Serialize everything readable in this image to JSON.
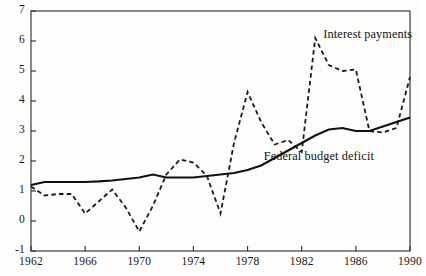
{
  "chart_data": {
    "type": "line",
    "title": "",
    "xlabel": "",
    "ylabel": "",
    "xlim": [
      1962,
      1990
    ],
    "ylim": [
      -1,
      7
    ],
    "grid": false,
    "legend_position": "inline-annotations",
    "yticks": [
      "7",
      "6",
      "5",
      "4",
      "3",
      "2",
      "1",
      "0",
      "-1"
    ],
    "ytick_values": [
      7,
      6,
      5,
      4,
      3,
      2,
      1,
      0,
      -1
    ],
    "xticks": [
      "1962",
      "1966",
      "1970",
      "1974",
      "1978",
      "1982",
      "1986",
      "1990"
    ],
    "xtick_values": [
      1962,
      1966,
      1970,
      1974,
      1978,
      1982,
      1986,
      1990
    ],
    "x": [
      1962,
      1963,
      1964,
      1965,
      1966,
      1967,
      1968,
      1969,
      1970,
      1971,
      1972,
      1973,
      1974,
      1975,
      1976,
      1977,
      1978,
      1979,
      1980,
      1981,
      1982,
      1983,
      1984,
      1985,
      1986,
      1987,
      1988,
      1989,
      1990
    ],
    "series": [
      {
        "name": "Interest payments",
        "style": "dashed",
        "color": "#1a1a1a",
        "values": [
          1.15,
          0.85,
          0.9,
          0.9,
          0.25,
          0.65,
          1.05,
          0.45,
          -0.35,
          0.5,
          1.55,
          2.05,
          1.95,
          1.5,
          0.25,
          2.6,
          4.3,
          3.3,
          2.55,
          2.7,
          2.3,
          6.1,
          5.2,
          5.0,
          5.05,
          3.0,
          2.95,
          3.1,
          4.8
        ]
      },
      {
        "name": "Federal budget deficit",
        "style": "solid",
        "color": "#111111",
        "values": [
          1.2,
          1.3,
          1.3,
          1.3,
          1.3,
          1.32,
          1.35,
          1.4,
          1.45,
          1.55,
          1.45,
          1.45,
          1.45,
          1.5,
          1.55,
          1.6,
          1.7,
          1.85,
          2.1,
          2.35,
          2.6,
          2.85,
          3.05,
          3.1,
          3.0,
          3.0,
          3.15,
          3.3,
          3.45
        ]
      }
    ],
    "annotations": [
      {
        "text": "Interest payments",
        "x": 1983.6,
        "y": 6.2
      },
      {
        "text": "Federal budget deficit",
        "x": 1979.2,
        "y": 2.15
      }
    ]
  },
  "source": {
    "note": ""
  }
}
